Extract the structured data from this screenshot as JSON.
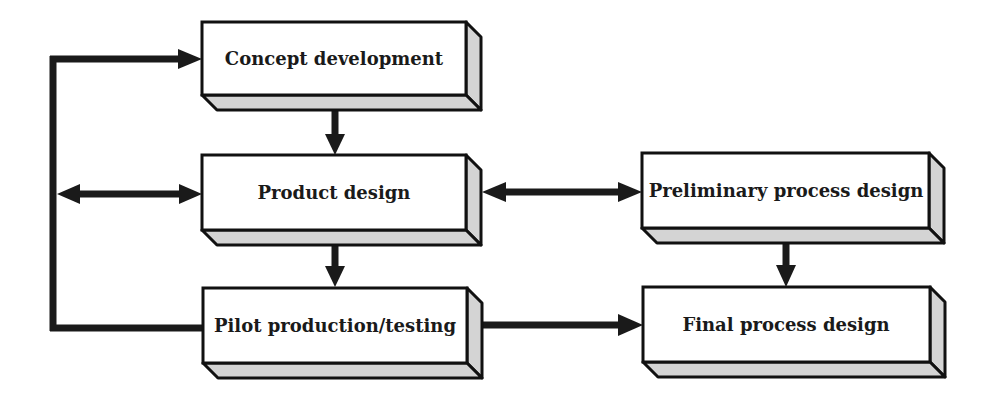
{
  "diagram": {
    "type": "flowchart",
    "title": "",
    "colors": {
      "box_face": "#ffffff",
      "box_shade": "#d4d4d4",
      "stroke": "#111111",
      "arrow": "#1a1a1a"
    },
    "nodes": [
      {
        "id": "concept",
        "label": "Concept development"
      },
      {
        "id": "product",
        "label": "Product design"
      },
      {
        "id": "pilot",
        "label": "Pilot production/testing"
      },
      {
        "id": "prelim",
        "label": "Preliminary process design"
      },
      {
        "id": "final",
        "label": "Final process design"
      }
    ],
    "edges": [
      {
        "from": "concept",
        "to": "product",
        "direction": "one-way"
      },
      {
        "from": "product",
        "to": "pilot",
        "direction": "one-way"
      },
      {
        "from": "product",
        "to": "prelim",
        "direction": "two-way"
      },
      {
        "from": "prelim",
        "to": "final",
        "direction": "one-way"
      },
      {
        "from": "pilot",
        "to": "final",
        "direction": "one-way"
      },
      {
        "from": "pilot",
        "to": "concept",
        "direction": "one-way",
        "via": "left-feedback-loop"
      },
      {
        "from": "left-feedback-loop",
        "to": "product",
        "direction": "two-way"
      }
    ]
  }
}
